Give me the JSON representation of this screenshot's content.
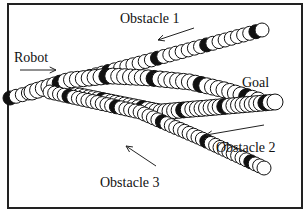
{
  "diagram": {
    "title": "",
    "labels": {
      "robot": "Robot",
      "goal": "Goal",
      "obstacle1": "Obstacle 1",
      "obstacle2": "Obstacle 2",
      "obstacle3": "Obstacle 3"
    },
    "label_positions": {
      "robot": [
        14,
        62
      ],
      "goal": [
        242,
        87
      ],
      "obstacle1": [
        120,
        23
      ],
      "obstacle2": [
        216,
        152
      ],
      "obstacle3": [
        100,
        187
      ]
    },
    "arrows": [
      {
        "name": "robot-direction-arrow",
        "from": [
          20,
          70
        ],
        "to": [
          56,
          70
        ]
      },
      {
        "name": "obstacle1-direction-arrow",
        "from": [
          194,
          28
        ],
        "to": [
          158,
          40
        ]
      },
      {
        "name": "obstacle2-direction-arrow",
        "from": [
          264,
          125
        ],
        "to": [
          206,
          135
        ]
      },
      {
        "name": "obstacle3-direction-arrow",
        "from": [
          156,
          166
        ],
        "to": [
          126,
          146
        ]
      }
    ],
    "frame": {
      "x": 8,
      "y": 4,
      "width": 294,
      "height": 204
    },
    "trajectories": [
      {
        "name": "obstacle1-trajectory",
        "label": "Obstacle 1",
        "points": [
          [
            10,
            98
          ],
          [
            262,
            30
          ]
        ],
        "radius": 7,
        "count": 42,
        "marker_every": 8,
        "marker_offset": 0
      },
      {
        "name": "robot-trajectory",
        "label": "Robot",
        "points": [
          [
            32,
            92
          ],
          [
            70,
            80
          ],
          [
            110,
            76
          ],
          [
            150,
            78
          ],
          [
            190,
            82
          ],
          [
            225,
            90
          ],
          [
            258,
            100
          ]
        ],
        "radius": 8,
        "count": 40,
        "marker_every": 8,
        "marker_offset": 3
      },
      {
        "name": "obstacle2-trajectory",
        "label": "Obstacle 2",
        "points": [
          [
            80,
            96
          ],
          [
            160,
            112
          ],
          [
            275,
            102
          ]
        ],
        "radius": 8,
        "count": 44,
        "marker_every": 9,
        "marker_offset": 4
      },
      {
        "name": "obstacle3-trajectory",
        "label": "Obstacle 3",
        "points": [
          [
            50,
            92
          ],
          [
            140,
            112
          ],
          [
            200,
            138
          ],
          [
            264,
            168
          ]
        ],
        "radius": 7,
        "count": 48,
        "marker_every": 10,
        "marker_offset": 6
      }
    ],
    "colors": {
      "ink": "#111111",
      "paper": "#ffffff",
      "marker": "#111111"
    }
  }
}
